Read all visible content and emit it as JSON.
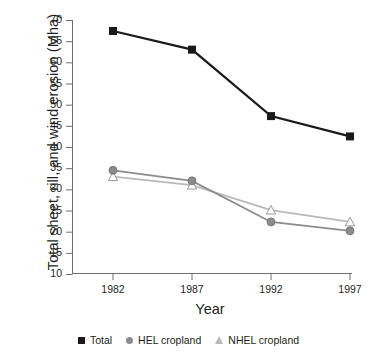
{
  "chart_data": {
    "type": "line",
    "title": "",
    "xlabel": "Year",
    "ylabel": "Total sheet, rill, and wind erosion (Mha)",
    "categories": [
      "1982",
      "1987",
      "1992",
      "1997"
    ],
    "x": [
      1982,
      1987,
      1992,
      1997
    ],
    "xlim": [
      1980.5,
      1998.5
    ],
    "ylim": [
      10,
      70
    ],
    "yticks": [
      10,
      15,
      20,
      25,
      30,
      35,
      40,
      45,
      50,
      55,
      60,
      65,
      70
    ],
    "ytick_labels": [
      "10",
      "15",
      "20",
      "25",
      "30",
      "35",
      "40",
      "45",
      "50",
      "55",
      "60",
      "65",
      "70"
    ],
    "grid": false,
    "legend_position": "bottom",
    "series": [
      {
        "name": "Total",
        "marker": "square",
        "color": "#1a1a1a",
        "values": [
          67.4,
          63.0,
          47.3,
          42.5
        ]
      },
      {
        "name": "HEL cropland",
        "marker": "circle",
        "color": "#8c8c8c",
        "values": [
          34.5,
          32.0,
          22.3,
          20.2
        ]
      },
      {
        "name": "NHEL cropland",
        "marker": "triangle",
        "color": "#b9b9b9",
        "values": [
          33.0,
          31.0,
          25.1,
          22.3
        ]
      }
    ]
  },
  "legend": {
    "items": [
      {
        "label": "Total",
        "marker": "square-marker-icon"
      },
      {
        "label": "HEL cropland",
        "marker": "circle-marker-icon"
      },
      {
        "label": "NHEL cropland",
        "marker": "triangle-marker-icon"
      }
    ]
  },
  "axes": {
    "y_title": "Total sheet, rill, and wind erosion (Mha)",
    "x_title": "Year"
  },
  "colors": {
    "total": "#1a1a1a",
    "hel": "#8c8c8c",
    "nhel": "#b9b9b9",
    "axis": "#6f6f6f",
    "text": "#231f20"
  }
}
